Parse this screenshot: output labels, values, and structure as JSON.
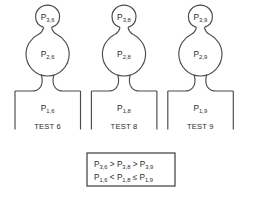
{
  "figure": {
    "background_color": "#ffffff",
    "line_color": "#4a4a4a",
    "text_color": "#2b2b2b"
  },
  "units": [
    {
      "test_label": "TEST 6",
      "top_bulb_label": "P",
      "top_bulb_sub": "3,6",
      "mid_bulb_label": "P",
      "mid_bulb_sub": "2,6",
      "base_label": "P",
      "base_sub": "1,6"
    },
    {
      "test_label": "TEST 8",
      "top_bulb_label": "P",
      "top_bulb_sub": "3,8",
      "mid_bulb_label": "P",
      "mid_bulb_sub": "2,8",
      "base_label": "P",
      "base_sub": "1,8"
    },
    {
      "test_label": "TEST 9",
      "top_bulb_label": "P",
      "top_bulb_sub": "3,9",
      "mid_bulb_label": "P",
      "mid_bulb_sub": "2,9",
      "base_label": "P",
      "base_sub": "1,9"
    }
  ],
  "equation_box": {
    "line1": {
      "t1": "P",
      "s1": "3,6",
      "op1": " > ",
      "t2": "P",
      "s2": "3,8",
      "op2": " > ",
      "t3": "P",
      "s3": "3,9"
    },
    "line2": {
      "t1": "P",
      "s1": "1,6",
      "op1": " < ",
      "t2": "P",
      "s2": "1,8",
      "op2": " ≤ ",
      "t3": "P",
      "s3": "1,9"
    }
  }
}
